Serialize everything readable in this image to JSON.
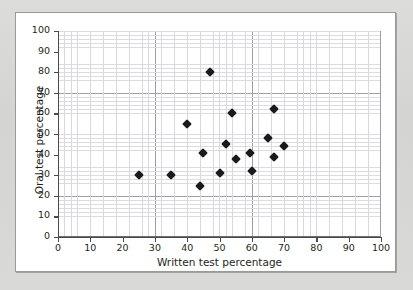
{
  "figure": {
    "background_color": "#d7d7d5",
    "card_color": "#ffffff",
    "card_border_color": "#9a9a98",
    "marker_color": "#1a1a1a",
    "grid_major_color": "#9d9da4",
    "grid_minor_color": "#d9d9dd",
    "axis_color": "#4a4a4c"
  },
  "chart_data": {
    "type": "scatter",
    "title": "",
    "xlabel": "Written test percentage",
    "ylabel": "Oral test percentage",
    "xlim": [
      0,
      100
    ],
    "ylim": [
      0,
      100
    ],
    "xticks": [
      0,
      10,
      20,
      30,
      40,
      50,
      60,
      70,
      80,
      90,
      100
    ],
    "yticks": [
      0,
      10,
      20,
      30,
      40,
      50,
      60,
      70,
      80,
      90,
      100
    ],
    "xtick_labels": [
      "0",
      "10",
      "20",
      "30",
      "40",
      "50",
      "60",
      "70",
      "80",
      "90",
      "100"
    ],
    "ytick_labels": [
      "0",
      "10",
      "20",
      "30",
      "40",
      "50",
      "60",
      "70",
      "80",
      "90",
      "100"
    ],
    "grid": true,
    "grid_major_step": 10,
    "grid_minor_step": 2,
    "legend": false,
    "legend_position": "none",
    "marker": "diamond",
    "n_points": 16,
    "points": [
      {
        "x": 25,
        "y": 30
      },
      {
        "x": 35,
        "y": 30
      },
      {
        "x": 40,
        "y": 55
      },
      {
        "x": 44,
        "y": 25
      },
      {
        "x": 45,
        "y": 41
      },
      {
        "x": 47,
        "y": 80
      },
      {
        "x": 50,
        "y": 31
      },
      {
        "x": 52,
        "y": 45
      },
      {
        "x": 54,
        "y": 60
      },
      {
        "x": 55,
        "y": 38
      },
      {
        "x": 59.5,
        "y": 41
      },
      {
        "x": 60,
        "y": 32
      },
      {
        "x": 65,
        "y": 48
      },
      {
        "x": 67,
        "y": 62
      },
      {
        "x": 67,
        "y": 39
      },
      {
        "x": 70,
        "y": 44
      }
    ]
  }
}
